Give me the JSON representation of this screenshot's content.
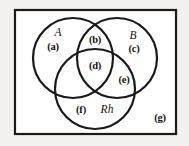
{
  "figure": {
    "kind": "venn-diagram",
    "universe_border_color": "#1a1a1a",
    "circle_stroke_color": "#1a1a1a",
    "inner_background": "#ffffff",
    "outer_background": "#f2f1ef",
    "set_labels": [
      {
        "id": "set-a",
        "text": "A",
        "x": 58,
        "y": 33
      },
      {
        "id": "set-b",
        "text": "B",
        "x": 133,
        "y": 36
      },
      {
        "id": "set-rh",
        "text": "Rh",
        "x": 107,
        "y": 110
      }
    ],
    "region_labels": [
      {
        "id": "region-a",
        "text": "(a)",
        "x": 53,
        "y": 47,
        "meaning": "A only"
      },
      {
        "id": "region-b",
        "text": "(b)",
        "x": 95,
        "y": 40,
        "meaning": "A and B, not Rh"
      },
      {
        "id": "region-c",
        "text": "(c)",
        "x": 134,
        "y": 49,
        "meaning": "B only"
      },
      {
        "id": "region-d",
        "text": "(d)",
        "x": 95,
        "y": 66,
        "meaning": "A and B and Rh"
      },
      {
        "id": "region-e",
        "text": "(e)",
        "x": 124,
        "y": 80,
        "meaning": "B and Rh, not A"
      },
      {
        "id": "region-f",
        "text": "(f)",
        "x": 81,
        "y": 110,
        "meaning": "Rh only"
      },
      {
        "id": "region-g",
        "text": "(g)",
        "x": 160,
        "y": 118,
        "meaning": "outside all sets"
      }
    ]
  }
}
